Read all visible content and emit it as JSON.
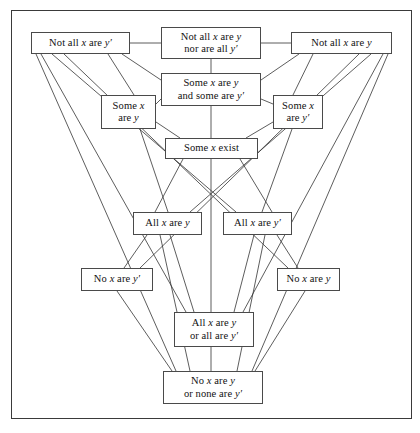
{
  "figure": {
    "type": "lattice-diagram",
    "title": "",
    "frame": {
      "border_color": "#3a3a3a"
    },
    "node_style": {
      "border_color": "#4a4a4a",
      "fill": "#ffffff",
      "text_color": "#111111"
    },
    "edge_style": {
      "stroke": "#333333",
      "width": 0.8
    }
  },
  "nodes": [
    {
      "id": "notall_yp",
      "label": "Not all x are y′",
      "x": 31,
      "y": 32,
      "w": 99,
      "h": 22
    },
    {
      "id": "notall_both",
      "label": "Not all x are y\nnor are all y′",
      "x": 161,
      "y": 27,
      "w": 100,
      "h": 32
    },
    {
      "id": "notall_y",
      "label": "Not all x are y",
      "x": 291,
      "y": 32,
      "w": 101,
      "h": 22
    },
    {
      "id": "some_both",
      "label": "Some x are y\nand some are y′",
      "x": 161,
      "y": 73,
      "w": 100,
      "h": 33
    },
    {
      "id": "some_y",
      "label": "Some x\nare y",
      "x": 101,
      "y": 95,
      "w": 55,
      "h": 34
    },
    {
      "id": "some_yp",
      "label": "Some x\nare y′",
      "x": 273,
      "y": 95,
      "w": 50,
      "h": 34
    },
    {
      "id": "some_exist",
      "label": "Some x exist",
      "x": 165,
      "y": 138,
      "w": 93,
      "h": 21
    },
    {
      "id": "all_y",
      "label": "All x are y",
      "x": 133,
      "y": 212,
      "w": 69,
      "h": 23
    },
    {
      "id": "all_yp",
      "label": "All x are y′",
      "x": 223,
      "y": 212,
      "w": 69,
      "h": 23
    },
    {
      "id": "no_yp",
      "label": "No x are y′",
      "x": 81,
      "y": 268,
      "w": 72,
      "h": 23
    },
    {
      "id": "no_y",
      "label": "No x are y",
      "x": 277,
      "y": 268,
      "w": 63,
      "h": 23
    },
    {
      "id": "all_or",
      "label": "All x are y\nor all are y′",
      "x": 174,
      "y": 312,
      "w": 80,
      "h": 35
    },
    {
      "id": "no_or",
      "label": "No x are y\nor none are y′",
      "x": 163,
      "y": 371,
      "w": 100,
      "h": 33
    }
  ],
  "edges": [
    {
      "from": "notall_yp",
      "to": "notall_both",
      "x1": 130,
      "y1": 43,
      "x2": 161,
      "y2": 43
    },
    {
      "from": "notall_both",
      "to": "notall_y",
      "x1": 261,
      "y1": 43,
      "x2": 291,
      "y2": 43
    },
    {
      "from": "notall_both",
      "to": "some_both",
      "x1": 211,
      "y1": 59,
      "x2": 211,
      "y2": 73
    },
    {
      "from": "notall_yp",
      "to": "some_both",
      "x1": 122,
      "y1": 54,
      "x2": 161,
      "y2": 80
    },
    {
      "from": "notall_y",
      "to": "some_both",
      "x1": 299,
      "y1": 54,
      "x2": 261,
      "y2": 80
    },
    {
      "from": "notall_yp",
      "to": "some_y",
      "x1": 108,
      "y1": 54,
      "x2": 134,
      "y2": 95
    },
    {
      "from": "notall_y",
      "to": "some_yp",
      "x1": 313,
      "y1": 54,
      "x2": 293,
      "y2": 95
    },
    {
      "from": "notall_yp",
      "to": "all_yp",
      "x1": 52,
      "y1": 54,
      "x2": 236,
      "y2": 212
    },
    {
      "from": "notall_yp",
      "to": "no_y",
      "x1": 64,
      "y1": 54,
      "x2": 288,
      "y2": 268
    },
    {
      "from": "notall_yp",
      "to": "all_or",
      "x1": 41,
      "y1": 54,
      "x2": 186,
      "y2": 312
    },
    {
      "from": "notall_yp",
      "to": "no_or",
      "x1": 36,
      "y1": 54,
      "x2": 176,
      "y2": 371
    },
    {
      "from": "notall_y",
      "to": "all_y",
      "x1": 371,
      "y1": 54,
      "x2": 190,
      "y2": 212
    },
    {
      "from": "notall_y",
      "to": "no_yp",
      "x1": 359,
      "y1": 54,
      "x2": 140,
      "y2": 268
    },
    {
      "from": "notall_y",
      "to": "all_or",
      "x1": 383,
      "y1": 54,
      "x2": 243,
      "y2": 312
    },
    {
      "from": "notall_y",
      "to": "no_or",
      "x1": 388,
      "y1": 54,
      "x2": 252,
      "y2": 371
    },
    {
      "from": "some_both",
      "to": "some_y",
      "x1": 161,
      "y1": 99,
      "x2": 156,
      "y2": 104
    },
    {
      "from": "some_both",
      "to": "some_yp",
      "x1": 261,
      "y1": 99,
      "x2": 273,
      "y2": 104
    },
    {
      "from": "some_both",
      "to": "some_exist",
      "x1": 211,
      "y1": 106,
      "x2": 211,
      "y2": 138
    },
    {
      "from": "some_y",
      "to": "some_exist",
      "x1": 156,
      "y1": 122,
      "x2": 180,
      "y2": 138
    },
    {
      "from": "some_yp",
      "to": "some_exist",
      "x1": 273,
      "y1": 122,
      "x2": 246,
      "y2": 138
    },
    {
      "from": "some_y",
      "to": "all_y",
      "x1": 140,
      "y1": 129,
      "x2": 168,
      "y2": 212
    },
    {
      "from": "some_yp",
      "to": "all_yp",
      "x1": 292,
      "y1": 129,
      "x2": 262,
      "y2": 212
    },
    {
      "from": "some_exist",
      "to": "all_y",
      "x1": 183,
      "y1": 159,
      "x2": 155,
      "y2": 212
    },
    {
      "from": "some_exist",
      "to": "all_yp",
      "x1": 240,
      "y1": 159,
      "x2": 272,
      "y2": 212
    },
    {
      "from": "some_exist",
      "to": "all_or",
      "x1": 211,
      "y1": 159,
      "x2": 211,
      "y2": 312
    },
    {
      "from": "all_y",
      "to": "no_yp",
      "x1": 147,
      "y1": 235,
      "x2": 124,
      "y2": 268
    },
    {
      "from": "all_yp",
      "to": "no_y",
      "x1": 277,
      "y1": 235,
      "x2": 298,
      "y2": 268
    },
    {
      "from": "all_y",
      "to": "all_or",
      "x1": 170,
      "y1": 235,
      "x2": 194,
      "y2": 312
    },
    {
      "from": "all_yp",
      "to": "all_or",
      "x1": 254,
      "y1": 235,
      "x2": 234,
      "y2": 312
    },
    {
      "from": "all_y",
      "to": "no_or",
      "x1": 160,
      "y1": 235,
      "x2": 190,
      "y2": 371
    },
    {
      "from": "all_yp",
      "to": "no_or",
      "x1": 265,
      "y1": 235,
      "x2": 237,
      "y2": 371
    },
    {
      "from": "no_yp",
      "to": "no_or",
      "x1": 117,
      "y1": 291,
      "x2": 172,
      "y2": 371
    },
    {
      "from": "no_y",
      "to": "no_or",
      "x1": 305,
      "y1": 291,
      "x2": 255,
      "y2": 371
    },
    {
      "from": "all_or",
      "to": "no_or",
      "x1": 211,
      "y1": 347,
      "x2": 211,
      "y2": 371
    }
  ]
}
